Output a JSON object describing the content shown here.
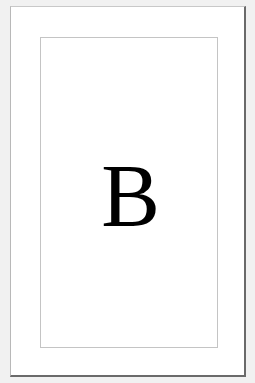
{
  "card": {
    "letter": "B"
  },
  "colors": {
    "background": "#f1f1f1",
    "card": "#ffffff",
    "frame_border": "#c4c4c4",
    "shadow_border": "#6a6a6a",
    "letter": "#000000"
  }
}
